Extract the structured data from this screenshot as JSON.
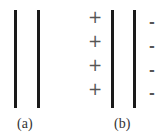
{
  "diagram": {
    "panels": [
      {
        "id": "a",
        "caption": "(a)",
        "plates": 2,
        "charges": {
          "left": [],
          "right": []
        }
      },
      {
        "id": "b",
        "caption": "(b)",
        "plates": 2,
        "charges": {
          "left": [
            "+",
            "+",
            "+",
            "+"
          ],
          "right": [
            "-",
            "-",
            "-",
            "-"
          ]
        }
      }
    ],
    "colors": {
      "plate": "#1a1a1a",
      "sign": "#555555",
      "caption": "#333333"
    }
  }
}
